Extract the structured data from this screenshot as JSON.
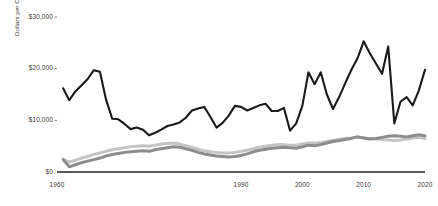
{
  "chart_data": {
    "type": "line",
    "title": "",
    "subtitle": "",
    "xlabel": "",
    "ylabel": "Dollars per Capita (2020$)",
    "xlim": [
      1960,
      2020
    ],
    "ylim": [
      0,
      30000
    ],
    "grid": false,
    "legend_position": "none",
    "y_ticks": [
      0,
      10000,
      20000,
      30000
    ],
    "y_tick_labels": [
      "$0",
      "$10,000",
      "$20,000",
      "$30,000"
    ],
    "x_ticks": [
      1960,
      1990,
      2000,
      2010,
      2020
    ],
    "x_tick_labels": [
      "1960",
      "1990",
      "2000",
      "2010",
      "2020"
    ],
    "colors": {
      "series_black": "#1a1a1a",
      "series_mid_gray": "#8c8c8c",
      "series_light_gray": "#c4c4c4",
      "axis": "#222222",
      "tick_text": "#3a3a3a"
    },
    "series": [
      {
        "name": "series-black",
        "color": "#1a1a1a",
        "line_width": 2.1,
        "x": [
          1961,
          1962,
          1963,
          1964,
          1965,
          1966,
          1967,
          1968,
          1969,
          1970,
          1971,
          1972,
          1973,
          1974,
          1975,
          1976,
          1977,
          1978,
          1979,
          1980,
          1981,
          1982,
          1983,
          1984,
          1985,
          1986,
          1987,
          1988,
          1989,
          1990,
          1991,
          1992,
          1993,
          1994,
          1995,
          1996,
          1997,
          1998,
          1999,
          2000,
          2001,
          2002,
          2003,
          2004,
          2005,
          2006,
          2007,
          2008,
          2009,
          2010,
          2011,
          2012,
          2013,
          2014,
          2015,
          2016,
          2017,
          2018,
          2019,
          2020
        ],
        "values": [
          16200,
          13900,
          15600,
          16800,
          18000,
          19700,
          19400,
          14000,
          10300,
          10200,
          9300,
          8300,
          8600,
          8200,
          7100,
          7600,
          8200,
          8900,
          9200,
          9600,
          10500,
          11900,
          12300,
          12600,
          10700,
          8600,
          9500,
          10900,
          12800,
          12600,
          11900,
          12400,
          12900,
          13200,
          11800,
          11800,
          12400,
          8000,
          9400,
          12800,
          19300,
          17000,
          19300,
          15000,
          12200,
          14500,
          17200,
          19800,
          22000,
          25300,
          23000,
          21000,
          19000,
          24300,
          9400,
          13600,
          14500,
          12900,
          15800,
          19800
        ]
      },
      {
        "name": "series-mid-gray",
        "color": "#8c8c8c",
        "line_width": 3.0,
        "x": [
          1961,
          1962,
          1963,
          1964,
          1965,
          1966,
          1967,
          1968,
          1969,
          1970,
          1971,
          1972,
          1973,
          1974,
          1975,
          1976,
          1977,
          1978,
          1979,
          1980,
          1981,
          1982,
          1983,
          1984,
          1985,
          1986,
          1987,
          1988,
          1989,
          1990,
          1991,
          1992,
          1993,
          1994,
          1995,
          1996,
          1997,
          1998,
          1999,
          2000,
          2001,
          2002,
          2003,
          2004,
          2005,
          2006,
          2007,
          2008,
          2009,
          2010,
          2011,
          2012,
          2013,
          2014,
          2015,
          2016,
          2017,
          2018,
          2019,
          2020
        ],
        "values": [
          2400,
          1000,
          1400,
          1800,
          2100,
          2400,
          2700,
          3100,
          3400,
          3600,
          3800,
          3900,
          4000,
          4100,
          4000,
          4300,
          4500,
          4700,
          4900,
          4800,
          4500,
          4200,
          3800,
          3500,
          3300,
          3100,
          3000,
          2900,
          3000,
          3200,
          3500,
          3900,
          4200,
          4400,
          4600,
          4700,
          4800,
          4700,
          4600,
          4900,
          5200,
          5100,
          5300,
          5600,
          5900,
          6100,
          6300,
          6500,
          6800,
          6600,
          6400,
          6500,
          6700,
          6900,
          7000,
          6900,
          6800,
          7000,
          7200,
          7000
        ]
      },
      {
        "name": "series-light-gray",
        "color": "#c4c4c4",
        "line_width": 3.0,
        "x": [
          1961,
          1962,
          1963,
          1964,
          1965,
          1966,
          1967,
          1968,
          1969,
          1970,
          1971,
          1972,
          1973,
          1974,
          1975,
          1976,
          1977,
          1978,
          1979,
          1980,
          1981,
          1982,
          1983,
          1984,
          1985,
          1986,
          1987,
          1988,
          1989,
          1990,
          1991,
          1992,
          1993,
          1994,
          1995,
          1996,
          1997,
          1998,
          1999,
          2000,
          2001,
          2002,
          2003,
          2004,
          2005,
          2006,
          2007,
          2008,
          2009,
          2010,
          2011,
          2012,
          2013,
          2014,
          2015,
          2016,
          2017,
          2018,
          2019,
          2020
        ],
        "values": [
          2500,
          1900,
          2300,
          2700,
          3000,
          3400,
          3700,
          4000,
          4300,
          4500,
          4700,
          4900,
          5000,
          5100,
          5000,
          5200,
          5400,
          5500,
          5600,
          5400,
          5100,
          4800,
          4400,
          4100,
          3900,
          3800,
          3700,
          3700,
          3800,
          4000,
          4200,
          4500,
          4800,
          5000,
          5200,
          5300,
          5300,
          5200,
          5200,
          5400,
          5600,
          5600,
          5700,
          5900,
          6100,
          6300,
          6500,
          6600,
          6800,
          6600,
          6500,
          6400,
          6300,
          6200,
          6100,
          6200,
          6400,
          6600,
          6700,
          6500
        ]
      }
    ]
  }
}
